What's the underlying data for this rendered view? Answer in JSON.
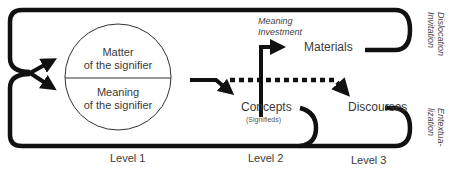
{
  "circle": {
    "top_label_line1": "Matter",
    "top_label_line2": "of the signifier",
    "bottom_label_line1": "Meaning",
    "bottom_label_line2": "of the signifier"
  },
  "nodes": {
    "materials": "Materials",
    "concepts": "Concepts",
    "concepts_sub": "(Signifieds)",
    "discourses": "Discourses"
  },
  "annotations": {
    "meaning_investment_line1": "Meaning",
    "meaning_investment_line2": "Investment",
    "dislocation_line1": "Dislocation",
    "dislocation_line2": "Invitation",
    "entextualization_line1": "Entextua-",
    "entextualization_line2": "lization"
  },
  "levels": [
    "Level 1",
    "Level 2",
    "Level 3"
  ],
  "colors": {
    "line": "#111111",
    "text": "#3a3a3a",
    "background": "#ffffff"
  }
}
